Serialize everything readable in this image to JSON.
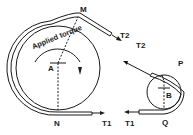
{
  "diagram": {
    "labels": {
      "applied_torque": "Applied torque",
      "point_M": "M",
      "point_A": "A",
      "point_N": "N",
      "point_P": "P",
      "point_B": "B",
      "point_Q": "Q",
      "tension_T2_left": "T2",
      "tension_T1_left": "T1",
      "tension_T2_right": "T2",
      "tension_T1_right": "T1"
    },
    "colors": {
      "stroke": "#1a1a1a",
      "background": "#ffffff"
    }
  }
}
